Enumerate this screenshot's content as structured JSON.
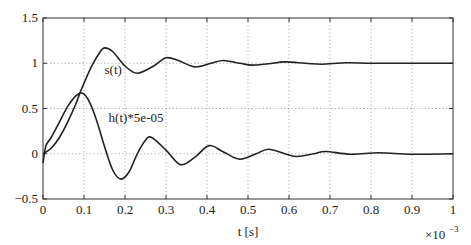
{
  "chart_data": {
    "type": "line",
    "title": "",
    "xlabel": "t [s]",
    "ylabel": "",
    "x_multiplier": "×10^-3",
    "xlim": [
      0,
      1
    ],
    "ylim": [
      -0.5,
      1.5
    ],
    "grid": true,
    "legend": "none (inline curve labels)",
    "xticks": [
      "0",
      "0.1",
      "0.2",
      "0.3",
      "0.4",
      "0.5",
      "0.6",
      "0.7",
      "0.8",
      "0.9",
      "1"
    ],
    "yticks": [
      "−0.5",
      "0",
      "0.5",
      "1",
      "1.5"
    ],
    "annotations": [
      {
        "text": "s(t)",
        "x": 0.15,
        "y": 0.88
      },
      {
        "text": "h(t)*5e-05",
        "x": 0.16,
        "y": 0.35
      }
    ],
    "series": [
      {
        "name": "s(t)",
        "x": [
          0,
          0.02,
          0.04,
          0.06,
          0.08,
          0.09,
          0.1,
          0.12,
          0.14,
          0.15,
          0.17,
          0.2,
          0.23,
          0.27,
          0.3,
          0.33,
          0.37,
          0.41,
          0.44,
          0.48,
          0.51,
          0.55,
          0.59,
          0.64,
          0.68,
          0.74,
          0.8,
          0.9,
          1.0
        ],
        "values": [
          0,
          0.06,
          0.18,
          0.35,
          0.55,
          0.67,
          0.78,
          0.98,
          1.13,
          1.17,
          1.13,
          0.97,
          0.89,
          0.97,
          1.06,
          1.03,
          0.96,
          1.0,
          1.03,
          1.0,
          0.98,
          0.995,
          1.015,
          1.0,
          0.99,
          1.005,
          1.0,
          1.0,
          1.0
        ]
      },
      {
        "name": "h(t)*5e-05",
        "x": [
          0,
          0.004,
          0.008,
          0.02,
          0.04,
          0.06,
          0.08,
          0.095,
          0.11,
          0.13,
          0.15,
          0.17,
          0.19,
          0.21,
          0.23,
          0.25,
          0.265,
          0.3,
          0.335,
          0.37,
          0.405,
          0.44,
          0.48,
          0.52,
          0.55,
          0.59,
          0.62,
          0.66,
          0.69,
          0.75,
          0.82,
          0.9,
          1.0
        ],
        "values": [
          -0.1,
          0.02,
          0.1,
          0.18,
          0.35,
          0.52,
          0.64,
          0.67,
          0.6,
          0.38,
          0.08,
          -0.18,
          -0.28,
          -0.2,
          0.0,
          0.15,
          0.18,
          0.04,
          -0.12,
          -0.04,
          0.09,
          0.02,
          -0.06,
          0.0,
          0.05,
          0.0,
          -0.03,
          0.0,
          0.025,
          -0.005,
          0.01,
          -0.005,
          0.0
        ]
      }
    ]
  }
}
